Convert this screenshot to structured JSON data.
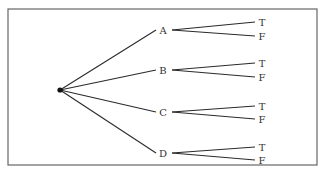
{
  "diagram": {
    "type": "tree",
    "frame": {
      "x": 8,
      "y": 9,
      "width": 309,
      "height": 156,
      "stroke": "#666666"
    },
    "root": {
      "x": 60,
      "y": 90,
      "r": 2.6,
      "color": "#111111"
    },
    "nodes": [
      {
        "label": "A",
        "x": 163,
        "y": 30,
        "children": [
          {
            "label": "T",
            "x": 262,
            "y": 22
          },
          {
            "label": "F",
            "x": 262,
            "y": 36
          }
        ]
      },
      {
        "label": "B",
        "x": 163,
        "y": 70,
        "children": [
          {
            "label": "T",
            "x": 262,
            "y": 63
          },
          {
            "label": "F",
            "x": 262,
            "y": 77
          }
        ]
      },
      {
        "label": "C",
        "x": 163,
        "y": 112,
        "children": [
          {
            "label": "T",
            "x": 262,
            "y": 106
          },
          {
            "label": "F",
            "x": 262,
            "y": 119
          }
        ]
      },
      {
        "label": "D",
        "x": 163,
        "y": 153,
        "children": [
          {
            "label": "T",
            "x": 262,
            "y": 147
          },
          {
            "label": "F",
            "x": 262,
            "y": 160
          }
        ]
      }
    ]
  }
}
